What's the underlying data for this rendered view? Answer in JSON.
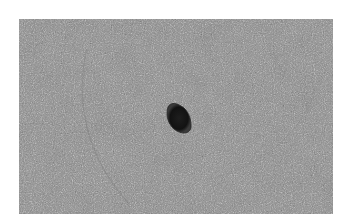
{
  "image": {
    "description": "Grayscale micrograph of a dense cell monolayer with a single dark, irregular pigmented cell cluster near the center",
    "background_color": "#ffffff",
    "field_color": "#9a9a9a",
    "object": {
      "label": "dark cell cluster",
      "color": "#141414",
      "center_x_pct": 56.5,
      "center_y_pct": 44
    }
  }
}
